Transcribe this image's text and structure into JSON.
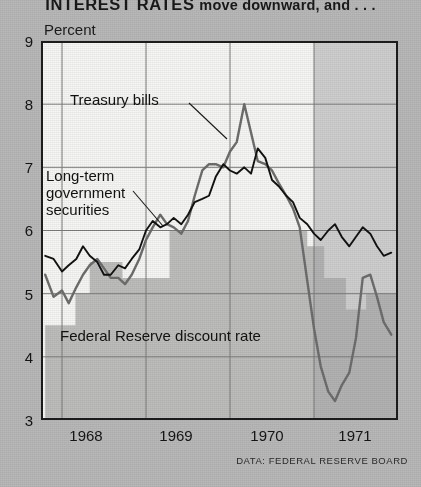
{
  "headline": {
    "lead": "INTEREST RATES",
    "tail": "move downward, and . . ."
  },
  "axis": {
    "unit_label": "Percent",
    "y_ticks": [
      "9",
      "8",
      "7",
      "6",
      "5",
      "4",
      "3"
    ],
    "x_ticks": [
      "1968",
      "1969",
      "1970",
      "1971"
    ]
  },
  "annotations": {
    "treasury": "Treasury bills",
    "longterm_line1": "Long-term",
    "longterm_line2": "government",
    "longterm_line3": "securities",
    "discount": "Federal Reserve discount rate"
  },
  "source": "DATA: FEDERAL RESERVE BOARD",
  "colors": {
    "page_background": "#b9b9b9",
    "plot_background": "#f7f7f5",
    "treasury_line": "#6e6e6e",
    "longterm_line": "#111111",
    "discount_area": "#a8a8a8",
    "forecast_band": "#cfcfcf",
    "frame": "#1c1c1c",
    "gridline": "#7d7d7d"
  },
  "chart_data": {
    "type": "line",
    "title": "INTEREST RATES move downward, and . . .",
    "xlabel": "",
    "ylabel": "Percent",
    "ylim": [
      3,
      9
    ],
    "xlim": [
      1967.75,
      1972.0
    ],
    "grid": true,
    "legend": "inline annotations",
    "source": "DATA: FEDERAL RESERVE BOARD",
    "y_ticks": [
      3,
      4,
      5,
      6,
      7,
      8,
      9
    ],
    "x_ticks": [
      1968,
      1969,
      1970,
      1971
    ],
    "shaded_region": {
      "from": 1971.0,
      "to": 1972.0,
      "note": "projected / highlighted period"
    },
    "series": [
      {
        "name": "Treasury bills",
        "style": "line",
        "color": "#6e6e6e",
        "x": [
          1967.8,
          1967.9,
          1968.0,
          1968.08,
          1968.17,
          1968.25,
          1968.33,
          1968.42,
          1968.5,
          1968.58,
          1968.67,
          1968.75,
          1968.83,
          1968.92,
          1969.0,
          1969.08,
          1969.17,
          1969.25,
          1969.33,
          1969.42,
          1969.5,
          1969.58,
          1969.67,
          1969.75,
          1969.83,
          1969.92,
          1970.0,
          1970.08,
          1970.17,
          1970.25,
          1970.33,
          1970.42,
          1970.5,
          1970.58,
          1970.67,
          1970.75,
          1970.83,
          1970.92,
          1971.0,
          1971.08,
          1971.17,
          1971.25,
          1971.33,
          1971.42,
          1971.5,
          1971.58,
          1971.67,
          1971.75,
          1971.83,
          1971.92
        ],
        "y": [
          5.3,
          4.95,
          5.05,
          4.85,
          5.1,
          5.3,
          5.45,
          5.55,
          5.4,
          5.25,
          5.25,
          5.15,
          5.3,
          5.55,
          5.85,
          6.05,
          6.25,
          6.1,
          6.05,
          5.95,
          6.15,
          6.55,
          6.95,
          7.05,
          7.05,
          7.0,
          7.25,
          7.4,
          8.0,
          7.55,
          7.1,
          7.05,
          6.95,
          6.75,
          6.55,
          6.35,
          6.05,
          5.2,
          4.45,
          3.85,
          3.45,
          3.3,
          3.55,
          3.75,
          4.3,
          5.25,
          5.3,
          4.95,
          4.55,
          4.35
        ],
        "y_range": [
          3.3,
          8.0
        ]
      },
      {
        "name": "Long-term government securities",
        "style": "line",
        "color": "#111111",
        "x": [
          1967.8,
          1967.9,
          1968.0,
          1968.08,
          1968.17,
          1968.25,
          1968.33,
          1968.42,
          1968.5,
          1968.58,
          1968.67,
          1968.75,
          1968.83,
          1968.92,
          1969.0,
          1969.08,
          1969.17,
          1969.25,
          1969.33,
          1969.42,
          1969.5,
          1969.58,
          1969.67,
          1969.75,
          1969.83,
          1969.92,
          1970.0,
          1970.08,
          1970.17,
          1970.25,
          1970.33,
          1970.42,
          1970.5,
          1970.58,
          1970.67,
          1970.75,
          1970.83,
          1970.92,
          1971.0,
          1971.08,
          1971.17,
          1971.25,
          1971.33,
          1971.42,
          1971.5,
          1971.58,
          1971.67,
          1971.75,
          1971.83,
          1971.92
        ],
        "y": [
          5.6,
          5.55,
          5.35,
          5.45,
          5.55,
          5.75,
          5.6,
          5.5,
          5.3,
          5.3,
          5.45,
          5.4,
          5.55,
          5.7,
          6.0,
          6.15,
          6.05,
          6.1,
          6.2,
          6.1,
          6.25,
          6.45,
          6.5,
          6.55,
          6.85,
          7.05,
          6.95,
          6.9,
          7.0,
          6.9,
          7.3,
          7.15,
          6.8,
          6.7,
          6.55,
          6.45,
          6.2,
          6.1,
          5.95,
          5.85,
          6.0,
          6.1,
          5.9,
          5.75,
          5.9,
          6.05,
          5.95,
          5.75,
          5.6,
          5.65
        ],
        "y_range": [
          5.3,
          7.3
        ]
      },
      {
        "name": "Federal Reserve discount rate",
        "style": "step-area",
        "color": "#a8a8a8",
        "x": [
          1967.8,
          1968.16,
          1968.16,
          1968.33,
          1968.33,
          1968.72,
          1968.72,
          1969.28,
          1969.28,
          1969.52,
          1969.52,
          1970.92,
          1970.92,
          1971.12,
          1971.12,
          1971.38,
          1971.38,
          1971.62,
          1971.62,
          1972.0
        ],
        "y": [
          4.5,
          4.5,
          5.0,
          5.0,
          5.5,
          5.5,
          5.25,
          5.25,
          6.0,
          6.0,
          6.0,
          6.0,
          5.75,
          5.75,
          5.25,
          5.25,
          4.75,
          4.75,
          5.0,
          5.0
        ],
        "y_range": [
          4.5,
          6.0
        ]
      }
    ]
  }
}
